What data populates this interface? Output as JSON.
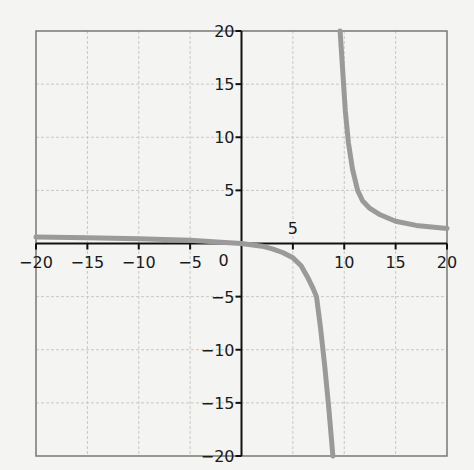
{
  "chart_data": {
    "type": "line",
    "title": "",
    "xlabel": "",
    "ylabel": "",
    "xlim": [
      -20,
      20
    ],
    "ylim": [
      -20,
      20
    ],
    "grid": true,
    "grid_step": 5,
    "x_ticks": [
      -20,
      -15,
      -10,
      -5,
      0,
      5,
      10,
      15,
      20
    ],
    "y_ticks": [
      -20,
      -15,
      -10,
      -5,
      5,
      10,
      15,
      20
    ],
    "x_tick_labels": [
      "−20",
      "−15",
      "−10",
      "−5",
      "0",
      "5",
      "10",
      "15",
      "20"
    ],
    "y_tick_labels": [
      "−20",
      "−15",
      "−10",
      "−5",
      "5",
      "10",
      "15",
      "20"
    ],
    "colors": {
      "curve": "#9a9a9a",
      "axis": "#111111",
      "grid": "#c8c8c8",
      "frame": "#777777",
      "background": "#f4f4f2"
    },
    "series": [
      {
        "name": "left-branch",
        "x": [
          -20,
          -15,
          -10,
          -5,
          -2,
          0,
          2,
          3,
          4,
          5,
          5.8,
          6.5,
          7,
          7.3,
          7.7,
          8.1,
          8.5,
          8.9
        ],
        "y": [
          0.6,
          0.55,
          0.45,
          0.3,
          0.12,
          0,
          -0.25,
          -0.5,
          -0.85,
          -1.35,
          -2.1,
          -3.3,
          -4.3,
          -5,
          -8,
          -11.5,
          -15.5,
          -20
        ]
      },
      {
        "name": "right-branch",
        "x": [
          9.6,
          9.8,
          10.1,
          10.4,
          10.8,
          11.3,
          11.8,
          12.5,
          13.5,
          15,
          17,
          20
        ],
        "y": [
          20,
          17,
          12.5,
          9.5,
          7,
          5,
          4,
          3.3,
          2.7,
          2.1,
          1.7,
          1.4
        ]
      }
    ]
  }
}
